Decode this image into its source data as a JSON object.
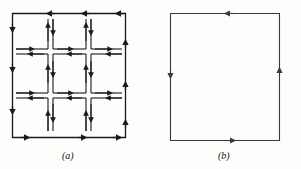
{
  "figure": {
    "panels": [
      {
        "id": "a",
        "caption": "(a)",
        "description": "Subdivided square region, 3 by 3 grid of cells, each cell boundary traversed counterclockwise; interior edges carry two opposing arrows that cancel",
        "grid_rows": 3,
        "grid_cols": 3,
        "orientation": "counterclockwise",
        "line_color": "#1a1a1a",
        "outer_stroke_width": 1.3,
        "inner_stroke_width": 1.1,
        "box": {
          "x": 12,
          "y": 13,
          "width": 114,
          "height": 125
        },
        "edge_arrow_directions": {
          "top": "left",
          "left": "down",
          "bottom": "right",
          "right": "up"
        }
      },
      {
        "id": "b",
        "caption": "(b)",
        "description": "Single outer square boundary traversed counterclockwise; only the outer contour survives",
        "orientation": "counterclockwise",
        "line_color": "#3a3a3a",
        "outer_stroke_width": 1.1,
        "box": {
          "x": 170,
          "y": 13,
          "width": 110,
          "height": 128
        },
        "edge_arrow_directions": {
          "top": "left",
          "left": "down",
          "bottom": "right",
          "right": "up"
        }
      }
    ]
  }
}
